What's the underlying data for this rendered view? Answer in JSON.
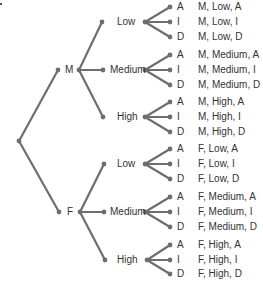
{
  "diagram": {
    "type": "tree-diagram",
    "colors": {
      "line": "#6e6e6e",
      "text": "#333333",
      "background": "#ffffff"
    },
    "root": {
      "x": 19,
      "y": 141
    },
    "levels": [
      {
        "name": "gender",
        "options": [
          "M",
          "F"
        ]
      },
      {
        "name": "level",
        "options": [
          "Low",
          "Medium",
          "High"
        ]
      },
      {
        "name": "outcome",
        "options": [
          "A",
          "I",
          "D"
        ]
      }
    ],
    "branches": [
      {
        "label": "M",
        "dot": [
          58,
          70
        ],
        "text_x": 65,
        "fork": [
          79,
          70
        ],
        "children": [
          {
            "label": "Low",
            "dot": [
              102,
              22
            ],
            "text_x": 117,
            "fork": [
              145,
              22
            ],
            "leaves": [
              {
                "label": "A",
                "y": 7,
                "outcome": "M, Low, A"
              },
              {
                "label": "I",
                "y": 22,
                "outcome": "M, Low, I"
              },
              {
                "label": "D",
                "y": 37,
                "outcome": "M, Low, D"
              }
            ]
          },
          {
            "label": "Medium",
            "dot": [
              103,
              70
            ],
            "text_x": 110,
            "fork": [
              145,
              70
            ],
            "leaves": [
              {
                "label": "A",
                "y": 55,
                "outcome": "M, Medium, A"
              },
              {
                "label": "I",
                "y": 70,
                "outcome": "M, Medium, I"
              },
              {
                "label": "D",
                "y": 85,
                "outcome": "M, Medium, D"
              }
            ]
          },
          {
            "label": "High",
            "dot": [
              103,
              117
            ],
            "text_x": 117,
            "fork": [
              145,
              117
            ],
            "leaves": [
              {
                "label": "A",
                "y": 102,
                "outcome": "M, High, A"
              },
              {
                "label": "I",
                "y": 117,
                "outcome": "M, High, I"
              },
              {
                "label": "D",
                "y": 132,
                "outcome": "M, High, D"
              }
            ]
          }
        ]
      },
      {
        "label": "F",
        "dot": [
          59,
          212
        ],
        "text_x": 67,
        "fork": [
          80,
          212
        ],
        "children": [
          {
            "label": "Low",
            "dot": [
              104,
              164
            ],
            "text_x": 117,
            "fork": [
              145,
              164
            ],
            "leaves": [
              {
                "label": "A",
                "y": 149,
                "outcome": "F, Low, A"
              },
              {
                "label": "I",
                "y": 164,
                "outcome": "F, Low, I"
              },
              {
                "label": "D",
                "y": 179,
                "outcome": "F, Low, D"
              }
            ]
          },
          {
            "label": "Medium",
            "dot": [
              104,
              212
            ],
            "text_x": 110,
            "fork": [
              145,
              212
            ],
            "leaves": [
              {
                "label": "A",
                "y": 197,
                "outcome": "F, Medium, A"
              },
              {
                "label": "I",
                "y": 212,
                "outcome": "F, Medium, I"
              },
              {
                "label": "D",
                "y": 227,
                "outcome": "F, Medium, D"
              }
            ]
          },
          {
            "label": "High",
            "dot": [
              105,
              260
            ],
            "text_x": 117,
            "fork": [
              147,
              260
            ],
            "leaves": [
              {
                "label": "A",
                "y": 245,
                "outcome": "F, High, A"
              },
              {
                "label": "I",
                "y": 260,
                "outcome": "F, High, I"
              },
              {
                "label": "D",
                "y": 274,
                "outcome": "F, High, D"
              }
            ]
          }
        ]
      }
    ]
  }
}
